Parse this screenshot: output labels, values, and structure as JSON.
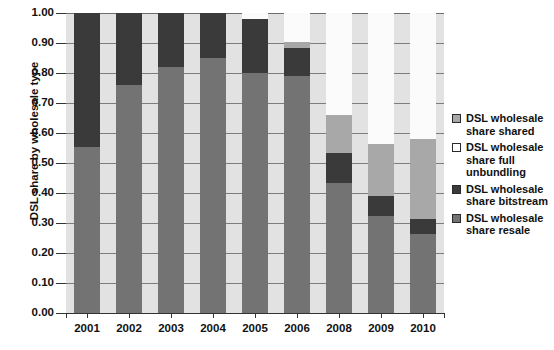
{
  "chart_data": {
    "type": "bar",
    "subtype": "stacked-bar-100-percent",
    "title": "",
    "xlabel": "",
    "ylabel": "DSL share by wholesale type",
    "ylim": [
      0.0,
      1.0
    ],
    "ytick_labels": [
      "0.00",
      "0.10",
      "0.20",
      "0.30",
      "0.40",
      "0.50",
      "0.60",
      "0.70",
      "0.80",
      "0.90",
      "1.00"
    ],
    "ytick_values": [
      0.0,
      0.1,
      0.2,
      0.3,
      0.4,
      0.5,
      0.6,
      0.7,
      0.8,
      0.9,
      1.0
    ],
    "grid": true,
    "legend_position": "right",
    "categories": [
      "2001",
      "2002",
      "2003",
      "2004",
      "2005",
      "2006",
      "2008",
      "2009",
      "2010"
    ],
    "series": [
      {
        "name": "DSL wholesale share resale",
        "color": "#737373",
        "values": [
          0.555,
          0.76,
          0.82,
          0.85,
          0.8,
          0.79,
          0.435,
          0.325,
          0.265
        ]
      },
      {
        "name": "DSL wholesale share bitstream",
        "color": "#3a3a3a",
        "values": [
          0.445,
          0.24,
          0.18,
          0.15,
          0.18,
          0.095,
          0.1,
          0.065,
          0.05
        ]
      },
      {
        "name": "DSL wholesale share shared",
        "color": "#a8a8a8",
        "values": [
          0.0,
          0.0,
          0.0,
          0.0,
          0.0,
          0.02,
          0.125,
          0.175,
          0.265
        ]
      },
      {
        "name": "DSL wholesale share full unbundling",
        "color": "#ffffff",
        "values": [
          0.0,
          0.0,
          0.0,
          0.0,
          0.02,
          0.095,
          0.34,
          0.435,
          0.42
        ]
      }
    ]
  },
  "legend": {
    "items": [
      {
        "label": "DSL wholesale\nshare shared",
        "swatch": "shared"
      },
      {
        "label": "DSL wholesale\nshare full\nunbundling",
        "swatch": "full"
      },
      {
        "label": "DSL wholesale\nshare bitstream",
        "swatch": "bitstream"
      },
      {
        "label": "DSL wholesale\nshare resale",
        "swatch": "resale"
      }
    ]
  }
}
